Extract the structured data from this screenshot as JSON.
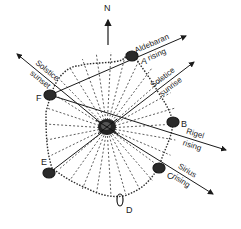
{
  "diagram": {
    "north_label": "N",
    "hub": {
      "x": 107,
      "y": 128
    },
    "rim": {
      "cx": 111,
      "cy": 124,
      "rx": 66,
      "ry": 72
    },
    "cairns": [
      {
        "id": "A",
        "label": "A",
        "x": 132,
        "y": 56,
        "lx": 141,
        "ly": 57
      },
      {
        "id": "B",
        "label": "B",
        "x": 173,
        "y": 122,
        "lx": 181,
        "ly": 120
      },
      {
        "id": "C",
        "label": "C",
        "x": 159,
        "y": 168,
        "lx": 167,
        "ly": 172
      },
      {
        "id": "D",
        "label": "D",
        "x": 120,
        "y": 200,
        "lx": 126,
        "ly": 206
      },
      {
        "id": "E",
        "label": "E",
        "x": 49,
        "y": 173,
        "lx": 41,
        "ly": 158
      },
      {
        "id": "F",
        "label": "F",
        "x": 50,
        "y": 95,
        "lx": 36,
        "ly": 94
      }
    ],
    "alignments": [
      {
        "name": "aldebaran-rising",
        "line1": "Aldebaran",
        "line2": "rising",
        "from": [
          50,
          95
        ],
        "to": [
          186,
          36
        ]
      },
      {
        "name": "solstice-sunset",
        "line1": "Solstice",
        "line2": "sunset",
        "from": [
          107,
          128
        ],
        "to": [
          17,
          54
        ]
      },
      {
        "name": "solstice-sunrise",
        "line1": "Solstice",
        "line2": "sunrise",
        "from": [
          49,
          173
        ],
        "to": [
          194,
          62
        ]
      },
      {
        "name": "rigel-rising",
        "line1": "Rigel",
        "line2": "rising",
        "from": [
          50,
          95
        ],
        "to": [
          226,
          150
        ]
      },
      {
        "name": "sirius-rising",
        "line1": "Sirius",
        "line2": "rising",
        "from": [
          107,
          128
        ],
        "to": [
          213,
          194
        ]
      }
    ],
    "colors": {
      "ink": "#1a1a1a",
      "background": "#ffffff"
    }
  }
}
